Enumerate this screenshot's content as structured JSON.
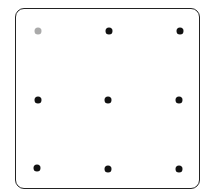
{
  "pattern_lock": {
    "rows": 3,
    "cols": 3,
    "colors": {
      "border": "#222222",
      "dot": "#111111",
      "dot_highlighted": "#aaaaaa"
    },
    "dots": [
      {
        "row": 0,
        "col": 0,
        "state": "highlighted"
      },
      {
        "row": 0,
        "col": 1,
        "state": "normal"
      },
      {
        "row": 0,
        "col": 2,
        "state": "normal"
      },
      {
        "row": 1,
        "col": 0,
        "state": "normal"
      },
      {
        "row": 1,
        "col": 1,
        "state": "normal"
      },
      {
        "row": 1,
        "col": 2,
        "state": "normal"
      },
      {
        "row": 2,
        "col": 0,
        "state": "normal"
      },
      {
        "row": 2,
        "col": 1,
        "state": "normal"
      },
      {
        "row": 2,
        "col": 2,
        "state": "normal"
      }
    ]
  }
}
